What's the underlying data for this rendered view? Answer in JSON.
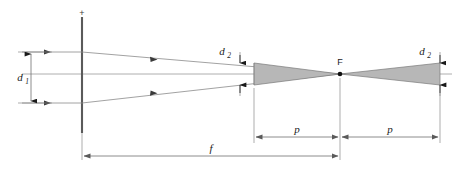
{
  "diagram": {
    "type": "optics-ray-diagram",
    "colors": {
      "line": "#6e6e6e",
      "ray": "#8a8a8a",
      "lens": "#5a5a5a",
      "cone_fill": "#b7b7b7",
      "cone_stroke": "#7a7a7a",
      "dim_line": "#6e6e6e",
      "text": "#1a1a1a",
      "background": "#ffffff"
    },
    "labels": {
      "d1": "d",
      "d1_sub": "1",
      "d2_left": "d",
      "d2_left_sub": "2",
      "d2_right": "d",
      "d2_right_sub": "2",
      "focal_point": "F",
      "f": "f",
      "p_left": "p",
      "p_right": "p",
      "lens_marker": "+"
    },
    "geometry": {
      "lens_x": 82,
      "lens_top_y": 17,
      "lens_bottom_y": 133,
      "axis_y": 74,
      "focal_x": 340,
      "aperture_left_x": 240,
      "aperture_right_x": 440,
      "d1_x": 30,
      "d1_top_y": 52,
      "d1_bottom_y": 103,
      "d2_half_height": 11,
      "f_dim_y": 155,
      "p_dim_y": 137
    },
    "elements": [
      {
        "name": "lens",
        "kind": "vertical-line"
      },
      {
        "name": "optical-axis",
        "kind": "horizontal-line"
      },
      {
        "name": "incoming-parallel-rays",
        "kind": "rays",
        "count": 2
      },
      {
        "name": "converging-cone",
        "kind": "filled-triangle"
      },
      {
        "name": "diverging-cone",
        "kind": "filled-triangle"
      },
      {
        "name": "focal-point",
        "kind": "dot"
      },
      {
        "name": "dimension-d1",
        "kind": "double-arrow-vertical"
      },
      {
        "name": "dimension-d2-left",
        "kind": "double-arrow-vertical"
      },
      {
        "name": "dimension-d2-right",
        "kind": "double-arrow-vertical"
      },
      {
        "name": "dimension-f",
        "kind": "double-arrow-horizontal"
      },
      {
        "name": "dimension-p-left",
        "kind": "double-arrow-horizontal"
      },
      {
        "name": "dimension-p-right",
        "kind": "double-arrow-horizontal"
      }
    ]
  }
}
